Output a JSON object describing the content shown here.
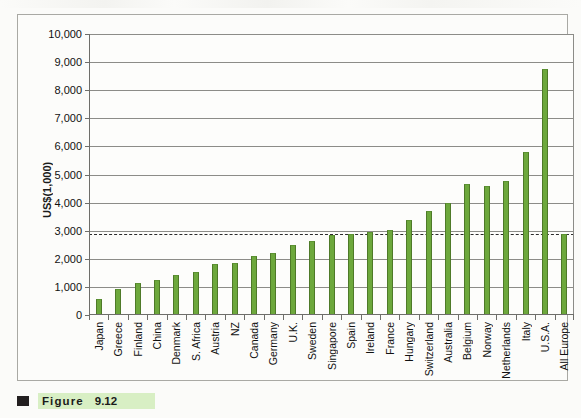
{
  "figure": {
    "caption_label": "Figure",
    "caption_number": "9.12"
  },
  "chart_data": {
    "type": "bar",
    "title": "",
    "subtitle": "",
    "xlabel": "",
    "ylabel": "US$(1,000)",
    "ylim": [
      0,
      10000
    ],
    "ytick_labels": [
      "10,000",
      "9,000",
      "8,000",
      "7,000",
      "6,000",
      "5,000",
      "4,000",
      "3,000",
      "2,000",
      "1,000",
      "0"
    ],
    "ytick_values": [
      10000,
      9000,
      8000,
      7000,
      6000,
      5000,
      4000,
      3000,
      2000,
      1000,
      0
    ],
    "grid": true,
    "legend": "none",
    "reference_line": {
      "value": 2900,
      "style": "dashed",
      "label": ""
    },
    "bar_color": "#6DA83C",
    "bar_edge_color": "#4E7A28",
    "categories": [
      "Japan",
      "Greece",
      "Finland",
      "China",
      "Denmark",
      "S. Africa",
      "Austria",
      "NZ",
      "Canada",
      "Germany",
      "U.K.",
      "Sweden",
      "Singapore",
      "Spain",
      "Ireland",
      "France",
      "Hungary",
      "Switzerland",
      "Australia",
      "Belgium",
      "Norway",
      "Netherlands",
      "Italy",
      "U.S.A.",
      "All Europe"
    ],
    "values": [
      560,
      920,
      1130,
      1240,
      1420,
      1540,
      1800,
      1840,
      2100,
      2200,
      2500,
      2640,
      2850,
      2900,
      2950,
      3020,
      3380,
      3700,
      4000,
      4650,
      4600,
      4760,
      5800,
      8750,
      2880
    ]
  }
}
